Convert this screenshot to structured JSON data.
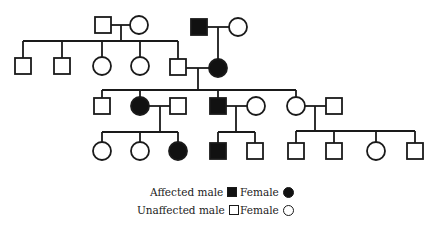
{
  "diagram": {
    "type": "pedigree-chart",
    "colors": {
      "line": "#1a1a1a",
      "affected_fill": "#111111",
      "unaffected_fill": "#ffffff"
    },
    "generations": [
      {
        "id": "I",
        "individuals": [
          {
            "id": "I-1",
            "sex": "male",
            "affected": false,
            "x": 103,
            "y": 25
          },
          {
            "id": "I-2",
            "sex": "female",
            "affected": false,
            "x": 139,
            "y": 25
          },
          {
            "id": "I-3",
            "sex": "male",
            "affected": true,
            "x": 199,
            "y": 27
          },
          {
            "id": "I-4",
            "sex": "female",
            "affected": false,
            "x": 238,
            "y": 27
          }
        ]
      },
      {
        "id": "II",
        "individuals": [
          {
            "id": "II-1",
            "sex": "male",
            "affected": false,
            "x": 23,
            "y": 66
          },
          {
            "id": "II-2",
            "sex": "male",
            "affected": false,
            "x": 62,
            "y": 66
          },
          {
            "id": "II-3",
            "sex": "female",
            "affected": false,
            "x": 102,
            "y": 66
          },
          {
            "id": "II-4",
            "sex": "female",
            "affected": false,
            "x": 140,
            "y": 66
          },
          {
            "id": "II-5",
            "sex": "male",
            "affected": false,
            "x": 178,
            "y": 67
          },
          {
            "id": "II-6",
            "sex": "female",
            "affected": true,
            "x": 218,
            "y": 68
          }
        ]
      },
      {
        "id": "III",
        "individuals": [
          {
            "id": "III-1",
            "sex": "male",
            "affected": false,
            "x": 102,
            "y": 106
          },
          {
            "id": "III-2",
            "sex": "female",
            "affected": true,
            "x": 140,
            "y": 106
          },
          {
            "id": "III-3",
            "sex": "male",
            "affected": false,
            "x": 178,
            "y": 106
          },
          {
            "id": "III-4",
            "sex": "male",
            "affected": true,
            "x": 218,
            "y": 106
          },
          {
            "id": "III-5",
            "sex": "female",
            "affected": false,
            "x": 256,
            "y": 106
          },
          {
            "id": "III-6",
            "sex": "female",
            "affected": false,
            "x": 296,
            "y": 106
          },
          {
            "id": "III-7",
            "sex": "male",
            "affected": false,
            "x": 334,
            "y": 106
          }
        ]
      },
      {
        "id": "IV",
        "individuals": [
          {
            "id": "IV-1",
            "sex": "female",
            "affected": false,
            "x": 102,
            "y": 151
          },
          {
            "id": "IV-2",
            "sex": "female",
            "affected": false,
            "x": 140,
            "y": 151
          },
          {
            "id": "IV-3",
            "sex": "female",
            "affected": true,
            "x": 178,
            "y": 151
          },
          {
            "id": "IV-4",
            "sex": "male",
            "affected": true,
            "x": 218,
            "y": 151
          },
          {
            "id": "IV-5",
            "sex": "male",
            "affected": false,
            "x": 255,
            "y": 151
          },
          {
            "id": "IV-6",
            "sex": "male",
            "affected": false,
            "x": 296,
            "y": 151
          },
          {
            "id": "IV-7",
            "sex": "male",
            "affected": false,
            "x": 334,
            "y": 151
          },
          {
            "id": "IV-8",
            "sex": "female",
            "affected": false,
            "x": 376,
            "y": 151
          },
          {
            "id": "IV-9",
            "sex": "male",
            "affected": false,
            "x": 415,
            "y": 151
          }
        ]
      }
    ],
    "lines": [
      [
        111,
        25,
        131,
        25
      ],
      [
        121,
        25,
        121,
        41
      ],
      [
        23,
        41,
        178,
        41
      ],
      [
        23,
        41,
        23,
        58
      ],
      [
        62,
        41,
        62,
        58
      ],
      [
        102,
        41,
        102,
        58
      ],
      [
        140,
        41,
        140,
        58
      ],
      [
        178,
        41,
        178,
        59
      ],
      [
        207,
        27,
        229,
        27
      ],
      [
        218,
        27,
        218,
        59
      ],
      [
        186,
        68,
        210,
        68
      ],
      [
        198,
        68,
        198,
        90
      ],
      [
        102,
        90,
        296,
        90
      ],
      [
        102,
        90,
        102,
        98
      ],
      [
        140,
        90,
        140,
        97
      ],
      [
        218,
        90,
        218,
        98
      ],
      [
        296,
        90,
        296,
        97
      ],
      [
        149,
        106,
        170,
        106
      ],
      [
        160,
        106,
        160,
        132
      ],
      [
        102,
        132,
        178,
        132
      ],
      [
        102,
        132,
        102,
        142
      ],
      [
        140,
        132,
        140,
        142
      ],
      [
        178,
        132,
        178,
        142
      ],
      [
        226,
        106,
        247,
        106
      ],
      [
        236,
        106,
        236,
        132
      ],
      [
        218,
        132,
        255,
        132
      ],
      [
        218,
        132,
        218,
        143
      ],
      [
        255,
        132,
        255,
        143
      ],
      [
        305,
        106,
        326,
        106
      ],
      [
        315,
        106,
        315,
        131
      ],
      [
        296,
        131,
        415,
        131
      ],
      [
        296,
        131,
        296,
        143
      ],
      [
        334,
        131,
        334,
        143
      ],
      [
        376,
        131,
        376,
        142
      ],
      [
        415,
        131,
        415,
        143
      ]
    ]
  },
  "legend": {
    "rows": [
      {
        "left_label": "Affected male",
        "left_symbol": "filled-square",
        "right_label": "Female",
        "right_symbol": "filled-circle"
      },
      {
        "left_label": "Unaffected male",
        "left_symbol": "empty-square",
        "right_label": "Female",
        "right_symbol": "empty-circle"
      }
    ]
  }
}
